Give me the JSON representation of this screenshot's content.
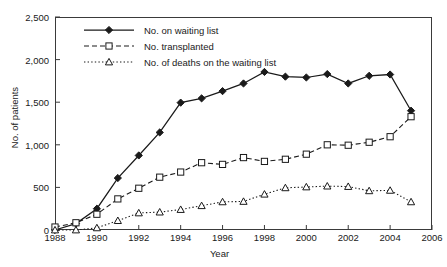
{
  "figure": {
    "artifact_text": "",
    "axis_title_x": "Year",
    "axis_title_y": "No. of patients"
  },
  "legend": {
    "position": "inside-top-left",
    "items": [
      {
        "label": "No. on waiting list",
        "style": "solid-line-filled-diamond",
        "color": "#1a1a1a"
      },
      {
        "label": "No. transplanted",
        "style": "dashed-line-open-square",
        "color": "#1a1a1a"
      },
      {
        "label": "No. of deaths on the waiting list",
        "style": "dotted-line-open-triangle",
        "color": "#1a1a1a"
      }
    ]
  },
  "chart_data": {
    "type": "line",
    "title": "",
    "subtitle": "",
    "xlabel": "Year",
    "ylabel": "No. of patients",
    "xlim": [
      1988,
      2006
    ],
    "ylim": [
      0,
      2500
    ],
    "grid": false,
    "legend_position": "upper left (inside axes)",
    "xticks": [
      1988,
      1990,
      1992,
      1994,
      1996,
      1998,
      2000,
      2002,
      2004,
      2006
    ],
    "xtick_labels": [
      "1988",
      "1990",
      "1992",
      "1994",
      "1996",
      "1998",
      "2000",
      "2002",
      "2004",
      "2006"
    ],
    "yticks": [
      0,
      500,
      1000,
      1500,
      2000,
      2500
    ],
    "ytick_labels": [
      "0",
      "500",
      "1,000",
      "1,500",
      "2,000",
      "2,500"
    ],
    "x": [
      1988,
      1989,
      1990,
      1991,
      1992,
      1993,
      1994,
      1995,
      1996,
      1997,
      1998,
      1999,
      2000,
      2001,
      2002,
      2003,
      2004,
      2005
    ],
    "series": [
      {
        "name": "No. on waiting list",
        "marker": "filled-diamond",
        "line": "solid",
        "values": [
          0,
          75,
          250,
          610,
          875,
          1145,
          1495,
          1545,
          1630,
          1720,
          1855,
          1800,
          1790,
          1830,
          1720,
          1810,
          1825,
          1400
        ]
      },
      {
        "name": "No. transplanted",
        "marker": "open-square",
        "line": "dashed",
        "values": [
          35,
          85,
          185,
          365,
          490,
          620,
          680,
          790,
          770,
          850,
          805,
          830,
          890,
          1000,
          995,
          1030,
          1095,
          1330
        ]
      },
      {
        "name": "No. of deaths on the waiting list",
        "marker": "open-triangle",
        "line": "dotted",
        "values": [
          0,
          0,
          25,
          110,
          200,
          210,
          240,
          285,
          330,
          335,
          420,
          495,
          505,
          515,
          510,
          460,
          465,
          330
        ]
      }
    ]
  }
}
